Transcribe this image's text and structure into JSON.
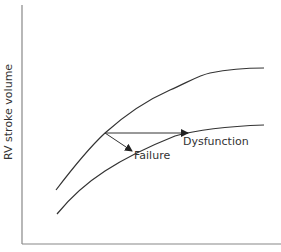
{
  "diagram": {
    "y_axis_label": "RV stroke volume",
    "x_axis_label": "",
    "labels": {
      "dysfunction": "Dysfunction",
      "failure": "Failure"
    },
    "curves": [
      {
        "name": "normal-curve",
        "description": "upper RV stroke volume curve"
      },
      {
        "name": "depressed-curve",
        "description": "lower RV stroke volume curve"
      }
    ],
    "arrows": [
      {
        "name": "dysfunction-arrow",
        "direction": "horizontal",
        "target": "Dysfunction"
      },
      {
        "name": "failure-arrow",
        "direction": "down-right",
        "target": "Failure"
      }
    ],
    "colors": {
      "line": "#333333",
      "axis": "#888888"
    }
  }
}
